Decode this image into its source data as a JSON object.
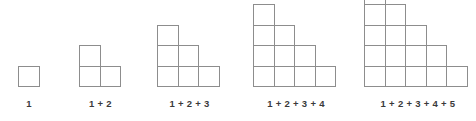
{
  "image": {
    "title": "Triangular numbers staircase diagram",
    "width": 476,
    "height": 121,
    "background_color": "#ffffff"
  },
  "style": {
    "cell_size": 21.5,
    "cell_border_color": "#8d8d8d",
    "cell_fill_color": "#ffffff",
    "caption_color": "#3a3a3a"
  },
  "figures": [
    {
      "index": 1,
      "caption": "1",
      "rows": [
        1
      ],
      "total": 1,
      "left": 18,
      "width": 22
    },
    {
      "index": 2,
      "caption": "1 + 2",
      "rows": [
        1,
        2
      ],
      "total": 3,
      "left": 79,
      "width": 43
    },
    {
      "index": 3,
      "caption": "1 + 2 + 3",
      "rows": [
        1,
        2,
        3
      ],
      "total": 6,
      "left": 157,
      "width": 65
    },
    {
      "index": 4,
      "caption": "1 + 2 + 3 + 4",
      "rows": [
        1,
        2,
        3,
        4
      ],
      "total": 10,
      "left": 253,
      "width": 86
    },
    {
      "index": 5,
      "caption": "1 + 2 + 3 + 4 + 5",
      "rows": [
        1,
        2,
        3,
        4,
        5
      ],
      "total": 15,
      "left": 364,
      "width": 108
    }
  ]
}
